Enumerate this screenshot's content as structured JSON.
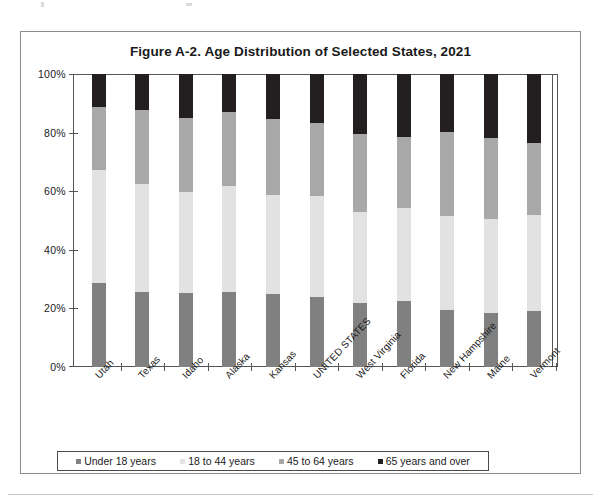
{
  "figure": {
    "title": "Figure A-2. Age Distribution of Selected States, 2021"
  },
  "legend": {
    "items": [
      {
        "label": "Under 18 years",
        "color": "#808080"
      },
      {
        "label": "18 to 44 years",
        "color": "#e2e2e2"
      },
      {
        "label": "45 to 64 years",
        "color": "#a8a8a8"
      },
      {
        "label": "65 years and over",
        "color": "#231f20"
      }
    ]
  },
  "chart_data": {
    "type": "bar",
    "subtype": "stacked-100-percent",
    "title": "Figure A-2. Age Distribution of Selected States, 2021",
    "xlabel": "",
    "ylabel": "",
    "ylim": [
      0,
      100
    ],
    "yticks": [
      "0%",
      "20%",
      "40%",
      "60%",
      "80%",
      "100%"
    ],
    "ytick_values": [
      0,
      20,
      40,
      60,
      80,
      100
    ],
    "grid": false,
    "legend_position": "bottom",
    "units": "percent",
    "categories": [
      "Utah",
      "Texas",
      "Idaho",
      "Alaska",
      "Kansas",
      "UNITED STATES",
      "West Virginia",
      "Florida",
      "New Hampshire",
      "Maine",
      "Vermont"
    ],
    "series": [
      {
        "name": "Under 18 years",
        "color": "#808080",
        "values": [
          28.7,
          25.7,
          25.3,
          25.7,
          24.9,
          24.0,
          21.9,
          22.6,
          19.3,
          18.6,
          19.1
        ]
      },
      {
        "name": "18 to 44 years",
        "color": "#e2e2e2",
        "values": [
          38.5,
          36.7,
          34.5,
          36.1,
          33.9,
          34.5,
          31.0,
          31.8,
          32.4,
          32.0,
          32.9
        ]
      },
      {
        "name": "45 to 64 years",
        "color": "#a8a8a8",
        "values": [
          21.6,
          25.3,
          25.3,
          25.3,
          25.7,
          24.9,
          26.5,
          24.0,
          28.4,
          27.7,
          24.6
        ]
      },
      {
        "name": "65 years and over",
        "color": "#231f20",
        "values": [
          11.2,
          12.3,
          14.9,
          12.9,
          15.5,
          16.6,
          20.6,
          21.6,
          19.9,
          21.7,
          23.4
        ]
      }
    ]
  }
}
